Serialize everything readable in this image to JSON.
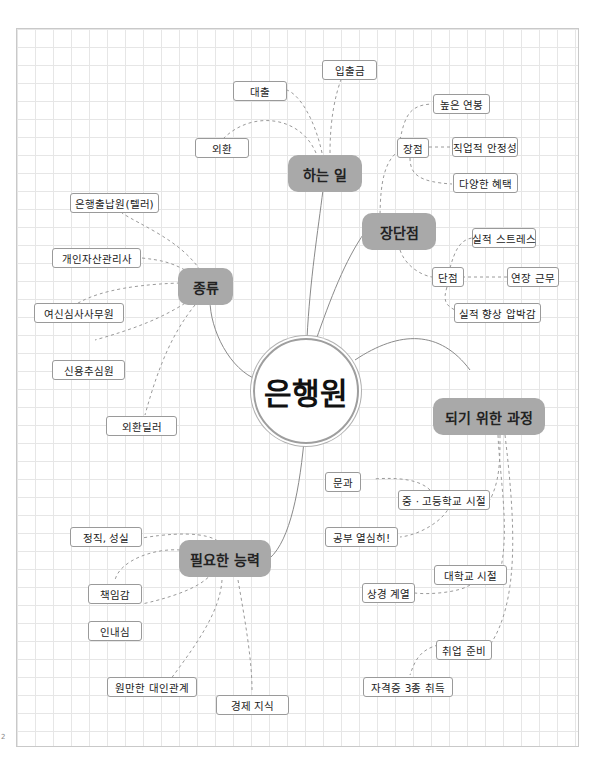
{
  "center": {
    "label": "은행원"
  },
  "branches": {
    "work": {
      "label": "하는 일",
      "items": [
        "입출금",
        "대출",
        "외환"
      ]
    },
    "pros_cons": {
      "label": "장단점",
      "pros": {
        "label": "장점",
        "items": [
          "높은 연봉",
          "직업적 안정성",
          "다양한 혜택"
        ]
      },
      "cons": {
        "label": "단점",
        "items": [
          "실적 스트레스",
          "연장 근무",
          "실적 향상 압박감"
        ]
      }
    },
    "types": {
      "label": "종류",
      "items": [
        "은행출납원(텔러)",
        "개인자산관리사",
        "여신심사사무원",
        "신용추심원",
        "외환딜러"
      ]
    },
    "path": {
      "label": "되기 위한 과정",
      "middle_high": {
        "label": "중 · 고등학교 시절",
        "items": [
          "문과",
          "공부 열심히!"
        ]
      },
      "college": {
        "label": "대학교 시절",
        "items": [
          "상경 계열"
        ]
      },
      "job_prep": {
        "label": "취업 준비",
        "items": [
          "자격증 3종 취득"
        ]
      }
    },
    "skills": {
      "label": "필요한 능력",
      "items": [
        "정직, 성실",
        "책임감",
        "인내심",
        "원만한 대인관계",
        "경제 지식"
      ]
    }
  },
  "colors": {
    "main_node": "#a9a9a9",
    "leaf_border": "#9a9a9a",
    "grid": "#e6e6e6",
    "line": "#8a8a8a"
  },
  "margin_mark": "2"
}
